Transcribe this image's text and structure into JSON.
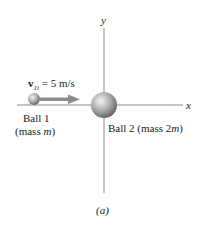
{
  "diagram": {
    "axes": {
      "x_label": "x",
      "y_label": "y"
    },
    "velocity": {
      "symbol": "v",
      "subscript": "1i",
      "equals": "= 5 m/s",
      "value": 5,
      "unit": "m/s"
    },
    "ball1": {
      "name": "Ball 1",
      "mass_label": "(mass ",
      "mass_symbol": "m",
      "mass_close": ")"
    },
    "ball2": {
      "name": "Ball 2 (mass 2",
      "mass_symbol": "m",
      "mass_close": ")"
    },
    "caption": "(a)",
    "colors": {
      "axis": "#8a8a8a",
      "arrow": "#8c8c8c",
      "ball_light": "#eeeeee",
      "ball_dark": "#6f6f6f"
    }
  }
}
